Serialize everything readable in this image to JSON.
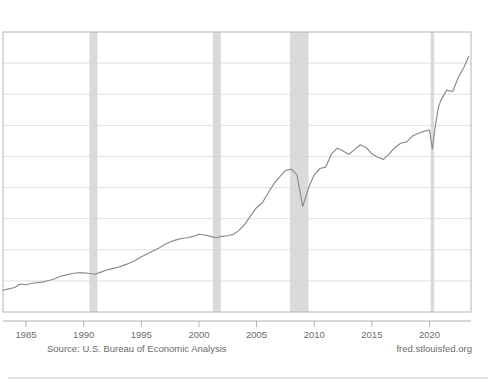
{
  "footer": {
    "source": "Source: U.S. Bureau of Economic Analysis",
    "site": "fred.stlouisfed.org"
  },
  "chart_data": {
    "type": "line",
    "title": "",
    "subtitle": "",
    "xlabel": "",
    "ylabel": "",
    "grid": true,
    "legend": "none",
    "xlim": [
      1983.0,
      2023.6
    ],
    "ylim": [
      0,
      8
    ],
    "xticks": [
      1985,
      1990,
      1995,
      2000,
      2005,
      2010,
      2015,
      2020
    ],
    "xticklabels": [
      "1985",
      "1990",
      "1995",
      "2000",
      "2005",
      "2010",
      "2015",
      "2020"
    ],
    "gridline_count": 8,
    "line_color": "#8a8a8a",
    "recession_band_color": "#d4d4d4",
    "recession_bands": [
      {
        "label": "1990-91 recession",
        "start": 1990.5,
        "end": 1991.2
      },
      {
        "label": "2001 recession",
        "start": 2001.2,
        "end": 2001.9
      },
      {
        "label": "2007-09 Great Recession",
        "start": 2007.9,
        "end": 2009.5
      },
      {
        "label": "2020 COVID-19 recession",
        "start": 2020.1,
        "end": 2020.4
      }
    ],
    "series": [
      {
        "name": "Value",
        "x": [
          1983.0,
          1983.5,
          1984.0,
          1984.5,
          1985.0,
          1985.5,
          1986.0,
          1986.5,
          1987.0,
          1987.5,
          1988.0,
          1988.5,
          1989.0,
          1989.5,
          1990.0,
          1990.5,
          1991.0,
          1991.5,
          1992.0,
          1992.5,
          1993.0,
          1993.5,
          1994.0,
          1994.5,
          1995.0,
          1995.5,
          1996.0,
          1996.5,
          1997.0,
          1997.5,
          1998.0,
          1998.5,
          1999.0,
          1999.5,
          2000.0,
          2000.5,
          2001.0,
          2001.5,
          2002.0,
          2002.5,
          2003.0,
          2003.5,
          2004.0,
          2004.5,
          2005.0,
          2005.5,
          2006.0,
          2006.5,
          2007.0,
          2007.5,
          2008.0,
          2008.5,
          2009.0,
          2009.5,
          2010.0,
          2010.5,
          2011.0,
          2011.5,
          2012.0,
          2012.5,
          2013.0,
          2013.5,
          2014.0,
          2014.5,
          2015.0,
          2015.5,
          2016.0,
          2016.5,
          2017.0,
          2017.5,
          2018.0,
          2018.5,
          2019.0,
          2019.5,
          2020.0,
          2020.25,
          2020.5,
          2020.75,
          2021.0,
          2021.5,
          2022.0,
          2022.5,
          2023.0,
          2023.4
        ],
        "values": [
          0.62,
          0.66,
          0.7,
          0.8,
          0.78,
          0.82,
          0.84,
          0.86,
          0.9,
          0.95,
          1.02,
          1.06,
          1.1,
          1.12,
          1.12,
          1.1,
          1.08,
          1.14,
          1.2,
          1.24,
          1.28,
          1.34,
          1.4,
          1.48,
          1.58,
          1.66,
          1.74,
          1.82,
          1.92,
          2.0,
          2.06,
          2.1,
          2.12,
          2.16,
          2.22,
          2.2,
          2.16,
          2.12,
          2.16,
          2.18,
          2.22,
          2.34,
          2.52,
          2.76,
          2.98,
          3.12,
          3.4,
          3.66,
          3.86,
          4.04,
          4.08,
          3.92,
          3.02,
          3.54,
          3.92,
          4.1,
          4.14,
          4.52,
          4.68,
          4.6,
          4.5,
          4.64,
          4.78,
          4.7,
          4.52,
          4.42,
          4.36,
          4.52,
          4.7,
          4.82,
          4.86,
          5.02,
          5.1,
          5.16,
          5.2,
          4.66,
          5.3,
          5.82,
          6.06,
          6.34,
          6.3,
          6.7,
          7.0,
          7.3
        ]
      }
    ]
  }
}
